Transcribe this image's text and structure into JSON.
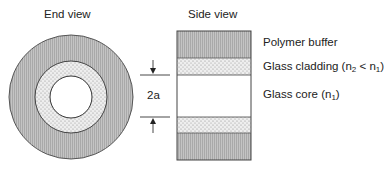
{
  "titles": {
    "end_view": "End view",
    "side_view": "Side view"
  },
  "dimension": {
    "label": "2a"
  },
  "layers": [
    {
      "name": "Polymer buffer",
      "label": "Polymer buffer",
      "fill": "#bdbdbd"
    },
    {
      "name": "Glass cladding",
      "label_prefix": "Glass cladding (n",
      "sub1": "2",
      "mid": " < n",
      "sub2": "1",
      "suffix": ")",
      "fill": "#e6e6e6"
    },
    {
      "name": "Glass core",
      "label_prefix": "Glass core (n",
      "sub1": "1",
      "suffix": ")",
      "fill": "#ffffff"
    }
  ]
}
